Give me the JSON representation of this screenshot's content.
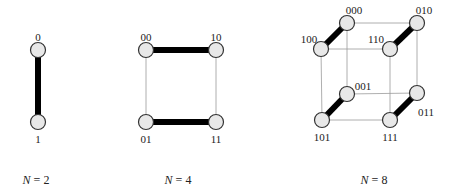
{
  "figure": {
    "panels": [
      {
        "id": "n2",
        "caption": {
          "var": "N",
          "eq": " = 2"
        },
        "nodes": [
          {
            "label": "0",
            "x": 38,
            "y": 50,
            "lx": 38,
            "ly": 38
          },
          {
            "label": "1",
            "x": 38,
            "y": 122,
            "lx": 38,
            "ly": 140
          }
        ],
        "thick_edges": [
          [
            0,
            1
          ]
        ],
        "thin_edges": []
      },
      {
        "id": "n4",
        "caption": {
          "var": "N",
          "eq": " = 4"
        },
        "nodes": [
          {
            "label": "00",
            "x": 146,
            "y": 50,
            "lx": 146,
            "ly": 38
          },
          {
            "label": "10",
            "x": 216,
            "y": 50,
            "lx": 216,
            "ly": 38
          },
          {
            "label": "01",
            "x": 146,
            "y": 122,
            "lx": 146,
            "ly": 140
          },
          {
            "label": "11",
            "x": 216,
            "y": 122,
            "lx": 216,
            "ly": 140
          }
        ],
        "thick_edges": [
          [
            0,
            1
          ],
          [
            2,
            3
          ]
        ],
        "thin_edges": [
          [
            0,
            2
          ],
          [
            1,
            3
          ]
        ]
      },
      {
        "id": "n8",
        "caption": {
          "var": "N",
          "eq": " = 8"
        },
        "nodes": [
          {
            "label": "000",
            "x": 347,
            "y": 23,
            "lx": 354,
            "ly": 11
          },
          {
            "label": "010",
            "x": 417,
            "y": 23,
            "lx": 424,
            "ly": 11
          },
          {
            "label": "100",
            "x": 321,
            "y": 49,
            "lx": 309,
            "ly": 40
          },
          {
            "label": "110",
            "x": 390,
            "y": 49,
            "lx": 376,
            "ly": 40
          },
          {
            "label": "001",
            "x": 347,
            "y": 94,
            "lx": 363,
            "ly": 87
          },
          {
            "label": "011",
            "x": 417,
            "y": 93,
            "lx": 426,
            "ly": 113
          },
          {
            "label": "101",
            "x": 322,
            "y": 120,
            "lx": 322,
            "ly": 138
          },
          {
            "label": "111",
            "x": 390,
            "y": 120,
            "lx": 390,
            "ly": 138
          }
        ],
        "thick_edges": [
          [
            0,
            2
          ],
          [
            1,
            3
          ],
          [
            4,
            6
          ],
          [
            5,
            7
          ]
        ],
        "thin_edges": [
          [
            0,
            1
          ],
          [
            2,
            3
          ],
          [
            4,
            5
          ],
          [
            6,
            7
          ],
          [
            0,
            4
          ],
          [
            1,
            5
          ],
          [
            2,
            6
          ],
          [
            3,
            7
          ]
        ]
      }
    ],
    "captions": [
      {
        "text_var": "N",
        "text_rest": " = 2",
        "x": 36,
        "y": 184
      },
      {
        "text_var": "N",
        "text_rest": " = 4",
        "x": 178,
        "y": 184
      },
      {
        "text_var": "N",
        "text_rest": " = 8",
        "x": 374,
        "y": 184
      }
    ]
  }
}
